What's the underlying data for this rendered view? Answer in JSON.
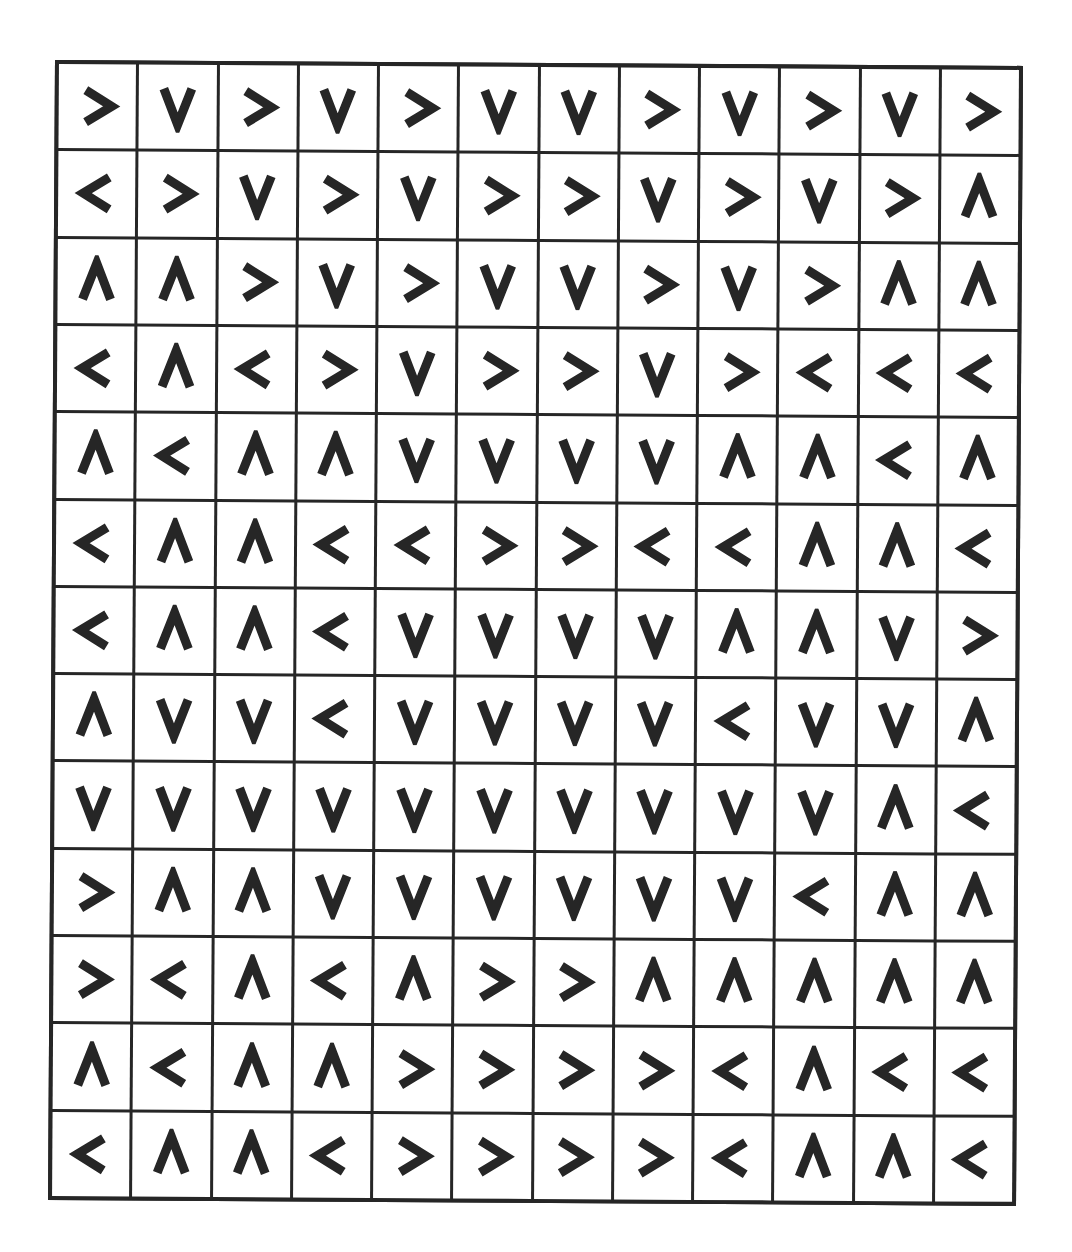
{
  "grid": {
    "rows": 13,
    "cols": 12,
    "legend": {
      ">": "arrow-right",
      "<": "arrow-left",
      "^": "arrow-up",
      "v": "arrow-down"
    },
    "stroke_color": "#262626",
    "background_color": "#ffffff",
    "cells": [
      [
        ">",
        "v",
        ">",
        "v",
        ">",
        "v",
        "v",
        ">",
        "v",
        ">",
        "v",
        ">"
      ],
      [
        "<",
        ">",
        "v",
        ">",
        "v",
        ">",
        ">",
        "v",
        ">",
        "v",
        ">",
        "^"
      ],
      [
        "^",
        "^",
        ">",
        "v",
        ">",
        "v",
        "v",
        ">",
        "v",
        ">",
        "^",
        "^"
      ],
      [
        "<",
        "^",
        "<",
        ">",
        "v",
        ">",
        ">",
        "v",
        ">",
        "<",
        "<",
        "<"
      ],
      [
        "^",
        "<",
        "^",
        "^",
        "v",
        "v",
        "v",
        "v",
        "^",
        "^",
        "<",
        "^"
      ],
      [
        "<",
        "^",
        "^",
        "<",
        "<",
        ">",
        ">",
        "<",
        "<",
        "^",
        "^",
        "<"
      ],
      [
        "<",
        "^",
        "^",
        "<",
        "v",
        "v",
        "v",
        "v",
        "^",
        "^",
        "v",
        ">"
      ],
      [
        "^",
        "v",
        "v",
        "<",
        "v",
        "v",
        "v",
        "v",
        "<",
        "v",
        "v",
        "^"
      ],
      [
        "v",
        "v",
        "v",
        "v",
        "v",
        "v",
        "v",
        "v",
        "v",
        "v",
        "^",
        "<"
      ],
      [
        ">",
        "^",
        "^",
        "v",
        "v",
        "v",
        "v",
        "v",
        "v",
        "<",
        "^",
        "^"
      ],
      [
        ">",
        "<",
        "^",
        "<",
        "^",
        ">",
        ">",
        "^",
        "^",
        "^",
        "^",
        "^"
      ],
      [
        "^",
        "<",
        "^",
        "^",
        ">",
        ">",
        ">",
        ">",
        "<",
        "^",
        "<",
        "<"
      ],
      [
        "<",
        "^",
        "^",
        "<",
        ">",
        ">",
        ">",
        ">",
        "<",
        "^",
        "^",
        "<"
      ]
    ]
  }
}
